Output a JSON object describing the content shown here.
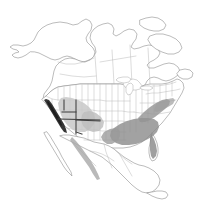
{
  "figure": {
    "caption": "",
    "width": 210,
    "height": 217,
    "background_color": "#ffffff"
  },
  "legend": {
    "visible": false,
    "entries": [
      {
        "label": "High density range",
        "color": "#2b2b2b",
        "description": "dark coastal band, California coast"
      },
      {
        "label": "Moderate density range",
        "color": "#909090",
        "description": "southeastern United States and Gulf states"
      },
      {
        "label": "Low density range",
        "color": "#c2c2c2",
        "description": "Great Basin, Southwest, Sierra Madre Occidental"
      }
    ]
  },
  "map": {
    "projection_hint": "lambert-conformal-conic",
    "outline_color": "#8e8e8e",
    "internal_border_color": "#b4b4b4",
    "emphasis_border_color": "#404040",
    "lake_fill": "#ffffff",
    "regions": [
      {
        "name": "california-coast",
        "shade": "dark",
        "color": "#2b2b2b",
        "description": "Narrow dark band hugging the Pacific coast of California"
      },
      {
        "name": "great-basin-southwest",
        "shade": "light",
        "color": "#c6c6c6",
        "description": "Diffuse light-gray area over Nevada, Utah, Arizona and New Mexico"
      },
      {
        "name": "southeast-gulf",
        "shade": "mid",
        "color": "#8e8e8e",
        "description": "Medium-gray region covering the southeastern United States from east Texas to the Atlantic coast and Florida"
      },
      {
        "name": "sierra-madre-occidental",
        "shade": "mid-light",
        "color": "#b0b0b0",
        "description": "Elongated gray band along western Mexico"
      },
      {
        "name": "atlantic-seaboard",
        "shade": "mid",
        "color": "#9a9a9a",
        "description": "Gray extension north along the mid-Atlantic coastal plain"
      }
    ],
    "emphasis_lines": {
      "name": "four-corners-emphasis",
      "description": "Darkened state boundary segments forming a cross near the Four Corners region"
    },
    "labels": []
  }
}
